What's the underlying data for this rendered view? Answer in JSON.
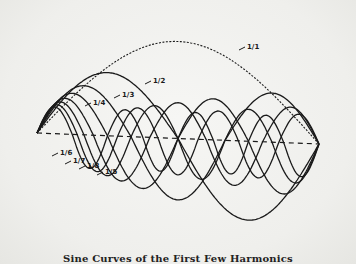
{
  "figure": {
    "caption": "Sine Curves of the First Few Harmonics",
    "line_color": "#1a1a1a",
    "background": "#f1f1ef",
    "baseline": {
      "x0": 37,
      "y0": 133,
      "x1": 319,
      "y1": 144,
      "style": "dashed"
    },
    "curves": [
      {
        "label": "1/1",
        "harmonic": 1,
        "style": "dashed",
        "label_pos": [
          247,
          47
        ]
      },
      {
        "label": "1/2",
        "harmonic": 2,
        "style": "solid",
        "label_pos": [
          153,
          81
        ]
      },
      {
        "label": "1/3",
        "harmonic": 3,
        "style": "solid",
        "label_pos": [
          122,
          95
        ]
      },
      {
        "label": "1/4",
        "harmonic": 4,
        "style": "solid",
        "label_pos": [
          93,
          103
        ]
      },
      {
        "label": "1/6",
        "harmonic": 6,
        "style": "solid",
        "label_pos": [
          60,
          153
        ]
      },
      {
        "label": "1/7",
        "harmonic": 7,
        "style": "solid",
        "label_pos": [
          73,
          161
        ]
      },
      {
        "label": "1/8",
        "harmonic": 8,
        "style": "solid",
        "label_pos": [
          87,
          166
        ]
      },
      {
        "label": "1/5",
        "harmonic": 5,
        "style": "solid",
        "label_pos": [
          105,
          172
        ]
      }
    ]
  }
}
